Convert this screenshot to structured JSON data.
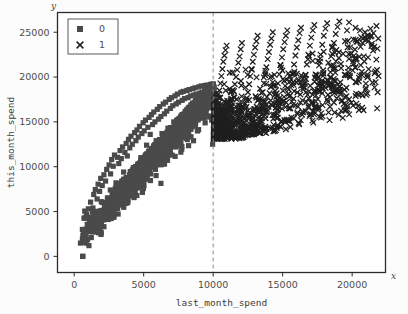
{
  "figure": {
    "background_color": "#fcfcfc",
    "plot_background_color": "#ffffff",
    "frame_color": "#2b2b2b",
    "x_axis_letter": "x",
    "y_axis_letter": "y"
  },
  "chart_data": {
    "type": "scatter",
    "title": "",
    "xlabel": "last_month_spend",
    "ylabel": "this_month_spend",
    "xlim": [
      -1200,
      22400
    ],
    "ylim": [
      -1800,
      27200
    ],
    "xticks": [
      0,
      5000,
      10000,
      15000,
      20000
    ],
    "xtick_labels": [
      "0",
      "5000",
      "10000",
      "15000",
      "20000"
    ],
    "yticks": [
      0,
      5000,
      10000,
      15000,
      20000,
      25000
    ],
    "ytick_labels": [
      "0",
      "5000",
      "10000",
      "15000",
      "20000",
      "25000"
    ],
    "grid": false,
    "legend": {
      "position": "upper-left",
      "entries": [
        {
          "label": "0",
          "marker": "square",
          "color": "#4a4a4a"
        },
        {
          "label": "1",
          "marker": "x",
          "color": "#1f1f1f"
        }
      ]
    },
    "annotations": [
      {
        "type": "vline",
        "x": 10000,
        "style": "dashed",
        "color": "#8c8c8c",
        "label": "threshold at 10000"
      }
    ],
    "series": [
      {
        "name": "0",
        "marker": "square",
        "color": "#4a4a4a",
        "marker_size": 5.2,
        "n_points": 620,
        "x_range": [
          400,
          10050
        ],
        "y_range": [
          0,
          19200
        ],
        "points": [
          [
            612,
            0
          ],
          [
            660,
            2950
          ],
          [
            705,
            4250
          ],
          [
            760,
            5050
          ],
          [
            880,
            4600
          ],
          [
            1020,
            5300
          ],
          [
            1180,
            6050
          ],
          [
            1320,
            5000
          ],
          [
            1410,
            6900
          ],
          [
            1520,
            7450
          ],
          [
            1650,
            6400
          ],
          [
            1720,
            8050
          ],
          [
            1830,
            7250
          ],
          [
            1910,
            8700
          ],
          [
            2020,
            7900
          ],
          [
            2140,
            9100
          ],
          [
            2260,
            8400
          ],
          [
            2340,
            9700
          ],
          [
            2420,
            6150
          ],
          [
            2510,
            10200
          ],
          [
            2620,
            9200
          ],
          [
            2700,
            10800
          ],
          [
            2810,
            10050
          ],
          [
            2900,
            11300
          ],
          [
            3010,
            8200
          ],
          [
            3120,
            11050
          ],
          [
            3210,
            10350
          ],
          [
            3300,
            11800
          ],
          [
            3390,
            10900
          ],
          [
            3480,
            12200
          ],
          [
            3560,
            9400
          ],
          [
            3650,
            11600
          ],
          [
            3740,
            12600
          ],
          [
            3820,
            11200
          ],
          [
            3910,
            13050
          ],
          [
            4000,
            12100
          ],
          [
            4090,
            13400
          ],
          [
            4180,
            12500
          ],
          [
            4260,
            9900
          ],
          [
            4350,
            13800
          ],
          [
            4440,
            12900
          ],
          [
            4520,
            14100
          ],
          [
            4610,
            13300
          ],
          [
            4700,
            14500
          ],
          [
            4790,
            11000
          ],
          [
            4870,
            13700
          ],
          [
            4960,
            14900
          ],
          [
            5040,
            14000
          ],
          [
            5130,
            15200
          ],
          [
            5210,
            12400
          ],
          [
            5300,
            14400
          ],
          [
            5390,
            15500
          ],
          [
            5470,
            13600
          ],
          [
            5560,
            15800
          ],
          [
            5640,
            14700
          ],
          [
            5730,
            16100
          ],
          [
            5810,
            15000
          ],
          [
            5900,
            12900
          ],
          [
            5980,
            16400
          ],
          [
            6070,
            15300
          ],
          [
            6150,
            16700
          ],
          [
            6240,
            15600
          ],
          [
            6320,
            13700
          ],
          [
            6410,
            17000
          ],
          [
            6490,
            15900
          ],
          [
            6580,
            17200
          ],
          [
            6660,
            16200
          ],
          [
            6750,
            14300
          ],
          [
            6830,
            17500
          ],
          [
            6920,
            16500
          ],
          [
            7000,
            17700
          ],
          [
            7090,
            16800
          ],
          [
            7170,
            15000
          ],
          [
            7260,
            17900
          ],
          [
            7340,
            17000
          ],
          [
            7430,
            18100
          ],
          [
            7510,
            17200
          ],
          [
            7600,
            15400
          ],
          [
            7680,
            18300
          ],
          [
            7770,
            17400
          ],
          [
            7850,
            18400
          ],
          [
            7940,
            17600
          ],
          [
            8020,
            15900
          ],
          [
            8110,
            18500
          ],
          [
            8190,
            17700
          ],
          [
            8280,
            18600
          ],
          [
            8360,
            17900
          ],
          [
            8450,
            16300
          ],
          [
            8530,
            18700
          ],
          [
            8620,
            18000
          ],
          [
            8700,
            18800
          ],
          [
            8790,
            18100
          ],
          [
            8870,
            16600
          ],
          [
            8960,
            18900
          ],
          [
            9040,
            18200
          ],
          [
            9130,
            19000
          ],
          [
            9210,
            18300
          ],
          [
            9300,
            16900
          ],
          [
            9380,
            19050
          ],
          [
            9470,
            18400
          ],
          [
            9550,
            19100
          ],
          [
            9640,
            18500
          ],
          [
            9720,
            17200
          ],
          [
            9810,
            19150
          ],
          [
            9890,
            18600
          ],
          [
            9980,
            19200
          ],
          [
            10030,
            18700
          ],
          [
            10040,
            17400
          ],
          [
            10020,
            13100
          ],
          [
            9960,
            12500
          ]
        ]
      },
      {
        "name": "1",
        "marker": "x",
        "color": "#1f1f1f",
        "marker_size": 5.5,
        "n_points": 520,
        "x_range": [
          10050,
          21900
        ],
        "y_range": [
          13100,
          26300
        ],
        "points": [
          [
            10080,
            13300
          ],
          [
            10120,
            14200
          ],
          [
            10180,
            15100
          ],
          [
            10240,
            16000
          ],
          [
            10310,
            16900
          ],
          [
            10380,
            17700
          ],
          [
            10450,
            18500
          ],
          [
            10520,
            19300
          ],
          [
            10590,
            20100
          ],
          [
            10660,
            20900
          ],
          [
            10730,
            21700
          ],
          [
            10810,
            22400
          ],
          [
            10890,
            23000
          ],
          [
            10970,
            23500
          ],
          [
            11060,
            13800
          ],
          [
            11140,
            14800
          ],
          [
            11220,
            15700
          ],
          [
            11300,
            16600
          ],
          [
            11390,
            17500
          ],
          [
            11470,
            18400
          ],
          [
            11560,
            19200
          ],
          [
            11640,
            20000
          ],
          [
            11730,
            20800
          ],
          [
            11810,
            21600
          ],
          [
            11900,
            22300
          ],
          [
            11980,
            23100
          ],
          [
            12070,
            23800
          ],
          [
            12160,
            14300
          ],
          [
            12240,
            15400
          ],
          [
            12330,
            16400
          ],
          [
            12410,
            17400
          ],
          [
            12500,
            18300
          ],
          [
            12590,
            19200
          ],
          [
            12670,
            20100
          ],
          [
            12760,
            20900
          ],
          [
            12850,
            21700
          ],
          [
            12930,
            22500
          ],
          [
            13020,
            23300
          ],
          [
            13110,
            24000
          ],
          [
            13200,
            24600
          ],
          [
            13290,
            15000
          ],
          [
            13380,
            16200
          ],
          [
            13470,
            17300
          ],
          [
            13560,
            18300
          ],
          [
            13650,
            19300
          ],
          [
            13740,
            20200
          ],
          [
            13830,
            21100
          ],
          [
            13920,
            22000
          ],
          [
            14010,
            22800
          ],
          [
            14100,
            23600
          ],
          [
            14190,
            24300
          ],
          [
            14290,
            25000
          ],
          [
            14380,
            15800
          ],
          [
            14470,
            17000
          ],
          [
            14570,
            18200
          ],
          [
            14660,
            19300
          ],
          [
            14760,
            20300
          ],
          [
            14850,
            21300
          ],
          [
            14950,
            22200
          ],
          [
            15040,
            23100
          ],
          [
            15140,
            23900
          ],
          [
            15230,
            24600
          ],
          [
            15330,
            25200
          ],
          [
            15430,
            16500
          ],
          [
            15520,
            17900
          ],
          [
            15620,
            19100
          ],
          [
            15720,
            20300
          ],
          [
            15820,
            21400
          ],
          [
            15920,
            22400
          ],
          [
            16020,
            23300
          ],
          [
            16120,
            24100
          ],
          [
            16220,
            24900
          ],
          [
            16320,
            25500
          ],
          [
            16430,
            17400
          ],
          [
            16530,
            18900
          ],
          [
            16640,
            20200
          ],
          [
            16740,
            21400
          ],
          [
            16850,
            22500
          ],
          [
            16960,
            23500
          ],
          [
            17060,
            24400
          ],
          [
            17170,
            25200
          ],
          [
            17280,
            25800
          ],
          [
            17390,
            18400
          ],
          [
            17500,
            19900
          ],
          [
            17620,
            21300
          ],
          [
            17730,
            22500
          ],
          [
            17850,
            23600
          ],
          [
            17960,
            24600
          ],
          [
            18080,
            25400
          ],
          [
            18200,
            26000
          ],
          [
            18320,
            19600
          ],
          [
            18440,
            21200
          ],
          [
            18570,
            22600
          ],
          [
            18690,
            23800
          ],
          [
            18820,
            24800
          ],
          [
            18950,
            25600
          ],
          [
            19080,
            26200
          ],
          [
            19210,
            21000
          ],
          [
            19350,
            22600
          ],
          [
            19490,
            24000
          ],
          [
            19630,
            25200
          ],
          [
            19780,
            26100
          ],
          [
            19930,
            22600
          ],
          [
            20080,
            24200
          ],
          [
            20240,
            25500
          ],
          [
            20400,
            24000
          ],
          [
            20570,
            25200
          ],
          [
            20750,
            23800
          ],
          [
            20930,
            25000
          ],
          [
            21120,
            24600
          ],
          [
            21320,
            25400
          ],
          [
            21530,
            24900
          ],
          [
            21750,
            25700
          ],
          [
            21880,
            24300
          ],
          [
            11250,
            13400
          ],
          [
            12100,
            13600
          ],
          [
            12950,
            13900
          ],
          [
            13800,
            14200
          ],
          [
            14650,
            14600
          ],
          [
            15500,
            15100
          ],
          [
            16400,
            15800
          ],
          [
            17300,
            16600
          ],
          [
            18200,
            17500
          ],
          [
            19100,
            18600
          ]
        ]
      }
    ]
  }
}
